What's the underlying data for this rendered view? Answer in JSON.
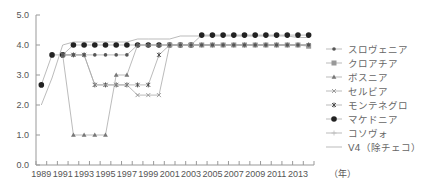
{
  "chart_data": {
    "type": "line",
    "title": "",
    "xlabel": "（年）",
    "ylabel": "",
    "ylim": [
      0,
      5
    ],
    "yticks": [
      "0.0",
      "1.0",
      "2.0",
      "3.0",
      "4.0",
      "5.0"
    ],
    "xticks": [
      "1989",
      "1991",
      "1993",
      "1995",
      "1997",
      "1999",
      "2001",
      "2003",
      "2005",
      "2007",
      "2009",
      "2011",
      "2013"
    ],
    "x": [
      1989,
      1990,
      1991,
      1992,
      1993,
      1994,
      1995,
      1996,
      1997,
      1998,
      1999,
      2000,
      2001,
      2002,
      2003,
      2004,
      2005,
      2006,
      2007,
      2008,
      2009,
      2010,
      2011,
      2012,
      2013,
      2014
    ],
    "legend_position": "right",
    "grid": false,
    "series": [
      {
        "name": "スロヴェニア",
        "marker": "diamond",
        "color": "#555555",
        "values": [
          null,
          null,
          3.67,
          3.67,
          3.67,
          3.67,
          3.67,
          3.67,
          3.67,
          4.0,
          4.0,
          4.0,
          4.0,
          4.0,
          4.0,
          4.0,
          4.0,
          4.0,
          4.0,
          4.0,
          4.0,
          4.0,
          4.0,
          4.0,
          4.0,
          4.0
        ]
      },
      {
        "name": "クロアチア",
        "marker": "square",
        "color": "#999999",
        "values": [
          null,
          null,
          null,
          null,
          null,
          null,
          null,
          null,
          null,
          null,
          null,
          null,
          4.0,
          4.0,
          4.0,
          4.0,
          4.0,
          4.0,
          4.0,
          4.0,
          4.0,
          4.0,
          4.0,
          4.0,
          4.0,
          3.96
        ]
      },
      {
        "name": "ボスニア",
        "marker": "triangle",
        "color": "#777777",
        "values": [
          null,
          null,
          3.67,
          1.0,
          1.0,
          1.0,
          1.0,
          3.0,
          3.0,
          4.0,
          4.0,
          4.0,
          4.0,
          4.0,
          4.0,
          4.0,
          4.0,
          4.0,
          4.0,
          4.0,
          4.0,
          4.0,
          4.0,
          4.0,
          4.0,
          4.0
        ]
      },
      {
        "name": "セルビア",
        "marker": "x",
        "color": "#888888",
        "values": [
          null,
          null,
          3.67,
          3.67,
          3.67,
          2.67,
          2.67,
          2.67,
          2.67,
          2.33,
          2.33,
          2.33,
          4.0,
          4.0,
          4.0,
          4.0,
          4.0,
          4.0,
          4.0,
          4.0,
          4.0,
          4.0,
          4.0,
          4.0,
          4.0,
          4.0
        ]
      },
      {
        "name": "モンテネグロ",
        "marker": "asterisk",
        "color": "#444444",
        "values": [
          null,
          null,
          3.67,
          3.67,
          3.67,
          2.67,
          2.67,
          2.67,
          2.67,
          2.67,
          2.67,
          3.67,
          4.0,
          4.0,
          4.0,
          4.0,
          4.0,
          4.0,
          4.0,
          4.0,
          4.0,
          4.0,
          4.0,
          4.0,
          4.0,
          4.0
        ]
      },
      {
        "name": "マケドニア",
        "marker": "circle",
        "color": "#222222",
        "values": [
          2.67,
          3.67,
          3.67,
          4.0,
          4.0,
          4.0,
          4.0,
          4.0,
          4.0,
          4.0,
          4.0,
          4.0,
          4.0,
          4.0,
          4.0,
          4.33,
          4.33,
          4.33,
          4.33,
          4.33,
          4.33,
          4.33,
          4.33,
          4.33,
          4.33,
          4.33
        ]
      },
      {
        "name": "コソヴォ",
        "marker": "plus",
        "color": "#bbbbbb",
        "values": [
          null,
          null,
          null,
          null,
          null,
          null,
          null,
          null,
          null,
          null,
          null,
          null,
          null,
          null,
          null,
          null,
          null,
          null,
          null,
          null,
          null,
          null,
          null,
          null,
          null,
          null
        ]
      },
      {
        "name": "V4（除チェコ）",
        "marker": "none",
        "color": "#999999",
        "values": [
          2.0,
          2.9,
          4.0,
          4.1,
          4.1,
          4.1,
          4.1,
          4.1,
          4.1,
          4.2,
          4.2,
          4.2,
          4.2,
          4.3,
          4.3,
          4.3,
          4.3,
          4.3,
          4.3,
          4.3,
          4.3,
          4.3,
          4.3,
          4.3,
          4.25,
          4.25
        ]
      }
    ]
  }
}
